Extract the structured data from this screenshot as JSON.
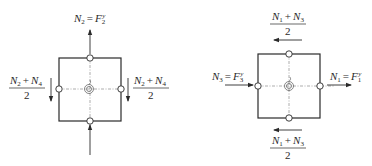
{
  "figure": {
    "colors": {
      "stroke": "#2a2a2a",
      "dash": "#8a8a8a",
      "background": "#ffffff"
    },
    "left_panel": {
      "top_label": {
        "lhs": "N",
        "lhs_sub": "2",
        "eq": "=",
        "rhs": "F",
        "rhs_sub": "2",
        "rhs_sup": "y"
      },
      "side_fraction": {
        "numerator_a": "N",
        "numerator_a_sub": "2",
        "plus": "+",
        "numerator_b": "N",
        "numerator_b_sub": "4",
        "denominator": "2"
      },
      "left_arrow_direction": "down",
      "right_arrow_direction": "down",
      "top_arrow_direction": "up",
      "bottom_arrow_direction": "up"
    },
    "right_panel": {
      "left_label": {
        "lhs": "N",
        "lhs_sub": "3",
        "eq": "=",
        "rhs": "F",
        "rhs_sub": "3",
        "rhs_sup": "y"
      },
      "right_label": {
        "lhs": "N",
        "lhs_sub": "1",
        "eq": "=",
        "rhs": "F",
        "rhs_sub": "1",
        "rhs_sup": "y"
      },
      "tb_fraction": {
        "numerator_a": "N",
        "numerator_a_sub": "1",
        "plus": "+",
        "numerator_b": "N",
        "numerator_b_sub": "3",
        "denominator": "2"
      },
      "top_arrow_direction": "left",
      "bottom_arrow_direction": "left",
      "left_arrow_direction": "right",
      "right_arrow_direction": "right"
    }
  }
}
